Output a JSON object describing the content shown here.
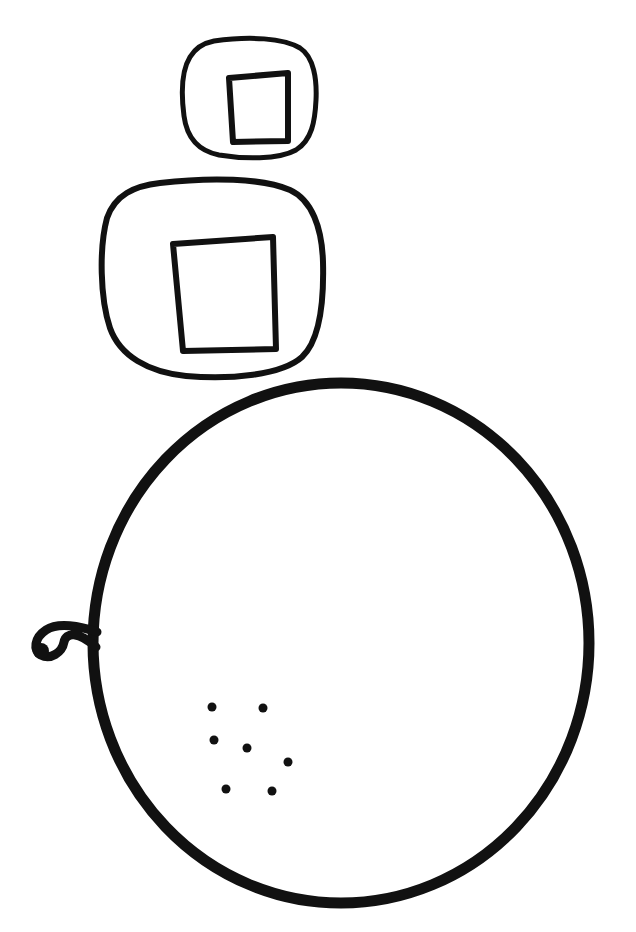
{
  "canvas": {
    "width": 636,
    "height": 932,
    "background_color": "#ffffff",
    "ink_color": "#111111",
    "style": "hand-drawn black line art, no text",
    "title": "Line drawing of two rounded squares and a seeded circle"
  },
  "figure": {
    "element_count": 4
  },
  "shapes": {
    "small_rounded_square": {
      "name": "small-rounded-square",
      "stroke_width": 5,
      "outer_path": "M 214 41 C 250 36 283 38 300 48 C 314 57 317 80 316 100 C 315 121 312 140 296 150 C 278 160 243 159 219 155 C 199 151 187 139 184 116 C 181 93 182 70 190 57 C 196 47 204 43 214 41 Z",
      "inner_quad_path": "M 229 78 L 288 73 L 288 141 L 233 142 Z",
      "inner_quad_stroke_width": 6,
      "bounds": {
        "x": 182,
        "y": 36,
        "width": 135,
        "height": 124
      }
    },
    "large_rounded_square": {
      "name": "large-rounded-square",
      "stroke_width": 6,
      "outer_path": "M 160 183 C 210 177 262 178 290 190 C 312 200 322 228 323 262 C 324 300 320 340 302 357 C 282 375 230 380 186 376 C 148 372 120 356 110 328 C 100 298 99 248 107 218 C 115 195 134 186 160 183 Z",
      "inner_quad_path": "M 173 244 L 273 237 L 276 349 L 183 351 Z",
      "inner_quad_stroke_width": 6,
      "bounds": {
        "x": 99,
        "y": 177,
        "width": 225,
        "height": 203
      }
    },
    "big_circle": {
      "name": "big-circle",
      "stroke_width": 11,
      "center_x": 341,
      "center_y": 643,
      "radius_x": 248,
      "radius_y": 260,
      "bounds": {
        "x": 93,
        "y": 383,
        "width": 496,
        "height": 520
      }
    },
    "stem": {
      "name": "curled-stem",
      "stroke_width": 9,
      "path": "M 97 632 C 80 626 58 622 46 630 C 34 638 33 650 41 655 C 50 660 62 653 64 642 C 66 632 78 631 96 647",
      "tip_blob": {
        "cx": 41,
        "cy": 651,
        "r": 8
      }
    }
  },
  "dots": {
    "name": "seed-dots",
    "count": 7,
    "radius": 4.5,
    "fill_color": "#111111",
    "points": [
      {
        "cx": 212,
        "cy": 707
      },
      {
        "cx": 263,
        "cy": 708
      },
      {
        "cx": 214,
        "cy": 740
      },
      {
        "cx": 247,
        "cy": 748
      },
      {
        "cx": 288,
        "cy": 762
      },
      {
        "cx": 226,
        "cy": 789
      },
      {
        "cx": 272,
        "cy": 791
      }
    ]
  }
}
